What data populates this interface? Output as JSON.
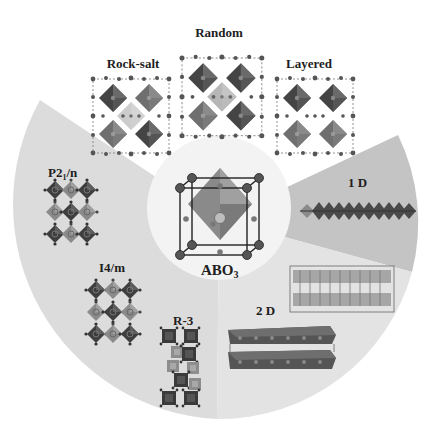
{
  "figure": {
    "type": "perovskite-structure-overview",
    "center": {
      "label": "ABO",
      "subscript": "3"
    },
    "top_group": {
      "title": "B-site ordering (double perovskite arrangements)",
      "items": [
        {
          "label": "Rock-salt"
        },
        {
          "label": "Random"
        },
        {
          "label": "Layered"
        }
      ]
    },
    "left_sector": {
      "items": [
        {
          "label": "P2",
          "subscript": "1",
          "suffix": "/n"
        },
        {
          "label": "I4/m"
        },
        {
          "label": "R-3"
        }
      ]
    },
    "right_upper_sector": {
      "label": "1 D"
    },
    "right_lower_sector": {
      "label": "2 D"
    },
    "colors": {
      "background": "#ffffff",
      "left_sector": "#dcdcdc",
      "sector_1d": "#c3c3c3",
      "sector_2d": "#e4e4e4",
      "inner_circle": "#f2f2f2",
      "octahedron_dark": "#3f3f3f",
      "octahedron_mid": "#6b6b6b",
      "octahedron_light": "#8e8e8e",
      "atom": "#4a4a4a"
    }
  }
}
